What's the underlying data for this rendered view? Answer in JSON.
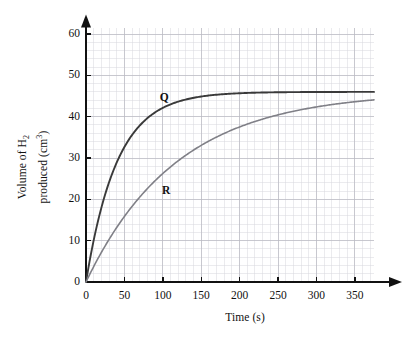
{
  "chart_data": {
    "type": "line",
    "title": "",
    "xlabel": "Time (s)",
    "ylabel_line1": "Volume of H",
    "ylabel_line1_sub": "2",
    "ylabel_line2": "produced (cm",
    "ylabel_line2_sup": "3",
    "ylabel_line2_end": ")",
    "ylabel_plain": "Volume of H2 produced (cm3)",
    "xlim": [
      0,
      375
    ],
    "ylim": [
      0,
      62
    ],
    "x_ticks": [
      0,
      50,
      100,
      150,
      200,
      250,
      300,
      350
    ],
    "x_tick_labels": [
      "0",
      "50",
      "100",
      "150",
      "200",
      "250",
      "300",
      "350"
    ],
    "y_ticks": [
      0,
      10,
      20,
      30,
      40,
      50,
      60
    ],
    "y_tick_labels": [
      "0",
      "10",
      "20",
      "30",
      "40",
      "50",
      "60"
    ],
    "x_minor_step": 10,
    "y_minor_step": 2,
    "grid": true,
    "grid_color": "#d8d8de",
    "axis_color": "#111111",
    "plateau_value": 46,
    "legend_position": "inline-labels",
    "series": [
      {
        "name": "Q",
        "label": "Q",
        "color": "#3a3a3a",
        "label_x": 100,
        "label_y": 44.5,
        "half_life": 28,
        "plateau": 46,
        "x": [
          0,
          10,
          20,
          30,
          40,
          50,
          60,
          70,
          80,
          90,
          100,
          120,
          140,
          160,
          180,
          200,
          225,
          250,
          275,
          300,
          325,
          350,
          375
        ],
        "values": [
          0,
          9.6,
          17.6,
          24.2,
          29.6,
          34.1,
          37.7,
          40.7,
          43.2,
          44.2,
          44.8,
          45.4,
          45.7,
          45.85,
          45.9,
          45.95,
          46,
          46,
          46,
          46,
          46,
          46,
          46
        ]
      },
      {
        "name": "R",
        "label": "R",
        "color": "#808087",
        "label_x": 103,
        "label_y": 22,
        "half_life": 82,
        "plateau": 46,
        "x": [
          0,
          10,
          20,
          30,
          40,
          50,
          60,
          70,
          80,
          90,
          100,
          120,
          140,
          160,
          180,
          200,
          225,
          250,
          275,
          300,
          325,
          350,
          375
        ],
        "values": [
          0,
          3.6,
          7.0,
          10.1,
          13.0,
          15.7,
          18.2,
          20.5,
          22.6,
          24.6,
          26.4,
          29.6,
          32.3,
          34.6,
          36.5,
          38.1,
          39.8,
          41.2,
          42.3,
          43.2,
          44.5,
          45.4,
          46
        ]
      }
    ]
  }
}
